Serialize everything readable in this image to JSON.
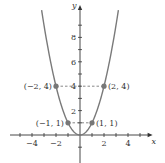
{
  "chart_data": {
    "type": "line",
    "title": "",
    "xlabel": "x",
    "ylabel": "y",
    "xlim": [
      -6,
      5.8
    ],
    "ylim": [
      -2.3,
      10.5
    ],
    "x_ticks": [
      -5,
      -4,
      -3,
      -2,
      -1,
      1,
      2,
      3,
      4,
      5
    ],
    "x_tick_labels": [
      {
        "value": -4,
        "label": "−4"
      },
      {
        "value": -2,
        "label": "−2"
      },
      {
        "value": 2,
        "label": "2"
      },
      {
        "value": 4,
        "label": "4"
      }
    ],
    "y_ticks": [
      -1,
      1,
      2,
      3,
      4,
      5,
      6,
      7,
      8,
      9
    ],
    "y_tick_labels": [
      {
        "value": 2,
        "label": "2"
      },
      {
        "value": 4,
        "label": "4"
      },
      {
        "value": 6,
        "label": "6"
      },
      {
        "value": 8,
        "label": "8"
      }
    ],
    "series": [
      {
        "name": "y = x^2",
        "function": "x^2",
        "x_range": [
          -3.2,
          3.2
        ],
        "color": "#7a7a7a"
      }
    ],
    "points": [
      {
        "x": -2,
        "y": 4,
        "label": "(−2, 4)",
        "side": "left"
      },
      {
        "x": 2,
        "y": 4,
        "label": "(2, 4)",
        "side": "right"
      },
      {
        "x": -1,
        "y": 1,
        "label": "(−1, 1)",
        "side": "left"
      },
      {
        "x": 1,
        "y": 1,
        "label": "(1, 1)",
        "side": "right"
      }
    ],
    "guide_lines": [
      {
        "y": 4,
        "from_x": -2,
        "to_x": 2,
        "style": "dashed"
      },
      {
        "y": 1,
        "from_x": -1,
        "to_x": 1,
        "style": "dashed"
      }
    ],
    "grid": false,
    "legend": "none"
  }
}
